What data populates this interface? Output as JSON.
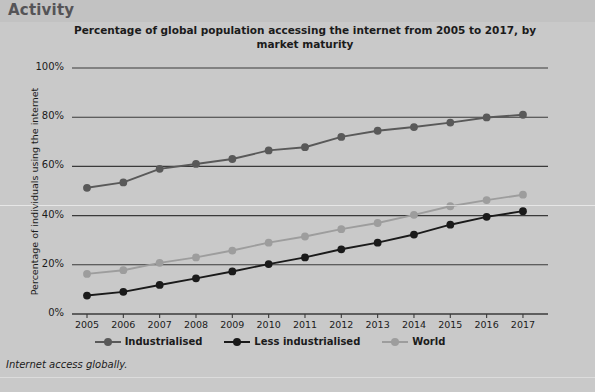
{
  "header": {
    "title": "Activity"
  },
  "caption": {
    "text": "Internet access globally.",
    "cut_off_line": ""
  },
  "colors": {
    "background": "#c9c9c9",
    "header_band": "#c2c2c2",
    "industrialised": "#595959",
    "less_industrialised": "#1a1a1a",
    "world": "#9d9d9d",
    "axis": "#3a3a3a",
    "text": "#1b1b1b"
  },
  "chart_data": {
    "type": "line",
    "title": "Percentage of global population accessing the internet from 2005 to 2017, by market maturity",
    "xlabel": "",
    "ylabel": "Percentage of individuals using the internet",
    "categories": [
      "2005",
      "2006",
      "2007",
      "2008",
      "2009",
      "2010",
      "2011",
      "2012",
      "2013",
      "2014",
      "2015",
      "2016",
      "2017"
    ],
    "x_tick_labels": [
      "2005",
      "2006",
      "2007",
      "2008",
      "2009",
      "2010",
      "2011",
      "2012",
      "2013",
      "2014",
      "2015",
      "2016",
      "2017"
    ],
    "y_tick_labels": [
      "0%",
      "20%",
      "40%",
      "60%",
      "80%",
      "100%"
    ],
    "y_tick_values": [
      0,
      20,
      40,
      60,
      80,
      100
    ],
    "ylim": [
      0,
      100
    ],
    "grid": true,
    "legend_position": "bottom",
    "series": [
      {
        "name": "Industrialised",
        "color": "#595959",
        "values": [
          51.3,
          53.5,
          59.0,
          61.0,
          63.0,
          66.5,
          67.8,
          72.0,
          74.5,
          76.0,
          77.8,
          79.9,
          81.0
        ]
      },
      {
        "name": "Less industrialised",
        "color": "#1a1a1a",
        "values": [
          7.5,
          9.0,
          11.8,
          14.5,
          17.3,
          20.3,
          23.0,
          26.3,
          29.0,
          32.3,
          36.3,
          39.5,
          41.8
        ]
      },
      {
        "name": "World",
        "color": "#9d9d9d",
        "values": [
          16.3,
          17.8,
          20.8,
          23.0,
          25.8,
          29.0,
          31.5,
          34.5,
          37.0,
          40.3,
          43.8,
          46.3,
          48.5
        ]
      }
    ]
  }
}
